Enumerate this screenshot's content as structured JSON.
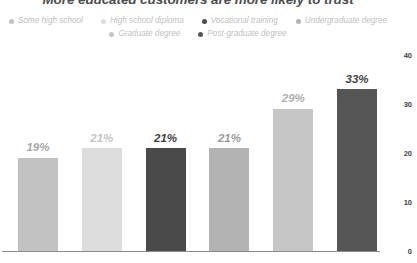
{
  "chart_data": {
    "type": "bar",
    "title": "More educated customers are more likely to trust",
    "xlabel": "",
    "ylabel": "",
    "ylim": [
      0,
      40
    ],
    "yticks": [
      0,
      10,
      20,
      30,
      40
    ],
    "grid": false,
    "legend_position": "top",
    "categories": [
      "Some high school",
      "High school diploma",
      "Vocational training",
      "Undergraduate degree",
      "Graduate degree",
      "Post-graduate degree"
    ],
    "values": [
      19,
      21,
      21,
      21,
      29,
      33
    ],
    "value_labels": [
      "19%",
      "21%",
      "21%",
      "21%",
      "29%",
      "33%"
    ],
    "bar_colors": [
      "#c2c2c2",
      "#dcdcdc",
      "#4a4a4a",
      "#b3b3b3",
      "#c6c6c6",
      "#555555"
    ],
    "label_colors": [
      "#a8a8a8",
      "#c4c4c4",
      "#3f3f3f",
      "#9a9a9a",
      "#b0b0b0",
      "#3f3f3f"
    ]
  },
  "legend": {
    "rows": [
      [
        {
          "label": "Some high school",
          "color": "#c2c2c2"
        },
        {
          "label": "High school diploma",
          "color": "#dcdcdc"
        },
        {
          "label": "Vocational training",
          "color": "#4a4a4a"
        },
        {
          "label": "Undergraduate degree",
          "color": "#b3b3b3"
        }
      ],
      [
        {
          "label": "Graduate degree",
          "color": "#c6c6c6"
        },
        {
          "label": "Post-graduate degree",
          "color": "#555555"
        }
      ]
    ]
  },
  "axis": {
    "y_tick_labels": [
      "40",
      "30",
      "20",
      "10",
      "0"
    ],
    "axis_line_color": "#8c8c8c"
  },
  "colors": {
    "title": "#4d4d4d",
    "legend_text": "#bfbfbf",
    "tick_text": "#3f3f3f",
    "background": "#ffffff"
  }
}
